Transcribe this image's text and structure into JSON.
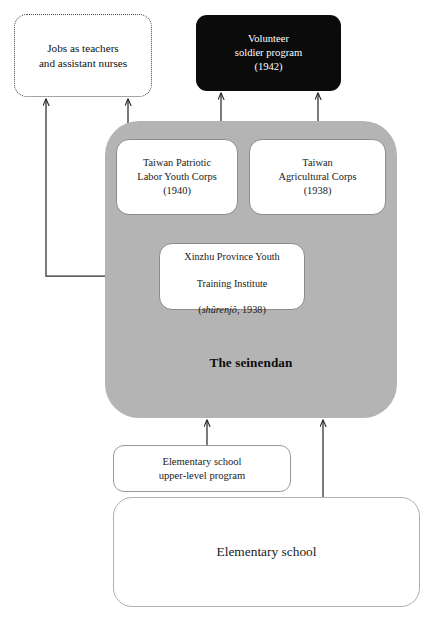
{
  "diagram": {
    "title_label": "The seinendan",
    "colors": {
      "container_gray": "#b4b4b4",
      "goal_black": "#0b0b0b",
      "goal_text": "#ffffff",
      "box_white": "#ffffff",
      "arrow_stroke": "#2b2b2b",
      "dashed_border": "#4a4a4a"
    },
    "nodes": {
      "outcome": {
        "line1": "Jobs as teachers",
        "line2": "and assistant nurses",
        "text": "Jobs as teachers\nand assistant nurses"
      },
      "goal": {
        "line1": "Volunteer",
        "line2": "soldier program",
        "line3": "(1942)",
        "text": "Volunteer\nsoldier program\n(1942)"
      },
      "corps_labor": {
        "line1": "Taiwan Patriotic",
        "line2": "Labor Youth Corps",
        "line3": "(1940)",
        "text": "Taiwan Patriotic\nLabor Youth Corps\n(1940)"
      },
      "corps_agricultural": {
        "line1": "Taiwan",
        "line2": "Agricultural Corps",
        "line3": "(1938)",
        "text": "Taiwan\nAgricultural Corps\n(1938)"
      },
      "xinzhu": {
        "line1": "Xinzhu Province Youth",
        "line2": "Training Institute",
        "line3_italic": "shûrenjô",
        "line3_rest": ", 1938)",
        "line3_open": "(",
        "text": "Xinzhu Province Youth\nTraining Institute\n(shûrenjô, 1938)"
      },
      "upper_level": {
        "line1": "Elementary school",
        "line2": "upper-level program",
        "text": "Elementary school\nupper-level program"
      },
      "elementary": {
        "text": "Elementary school"
      }
    },
    "edges": [
      {
        "name": "corps-labor-to-goal",
        "from": "corps_labor",
        "to": "goal"
      },
      {
        "name": "corps-agricultural-to-goal",
        "from": "corps_agricultural",
        "to": "goal"
      },
      {
        "name": "corps-labor-to-outcome",
        "from": "corps_labor",
        "to": "outcome"
      },
      {
        "name": "xinzhu-to-corps-labor",
        "from": "xinzhu",
        "to": "corps_labor"
      },
      {
        "name": "xinzhu-to-outcome",
        "from": "xinzhu",
        "to": "outcome"
      },
      {
        "name": "upper-level-to-seinendan",
        "from": "upper_level",
        "to": "seinendan"
      },
      {
        "name": "elementary-to-seinendan",
        "from": "elementary",
        "to": "seinendan"
      }
    ]
  }
}
